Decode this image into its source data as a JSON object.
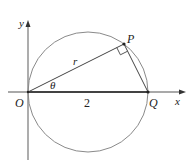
{
  "diagram": {
    "type": "geometry",
    "axes": {
      "x_label": "x",
      "y_label": "y"
    },
    "points": {
      "origin": "O",
      "top_point": "P",
      "right_point": "Q"
    },
    "labels": {
      "radius_segment": "r",
      "angle": "θ",
      "diameter_length": "2"
    },
    "right_angle_at": "P",
    "colors": {
      "circle": "#888888",
      "lines": "#333333",
      "text": "#222222"
    }
  }
}
